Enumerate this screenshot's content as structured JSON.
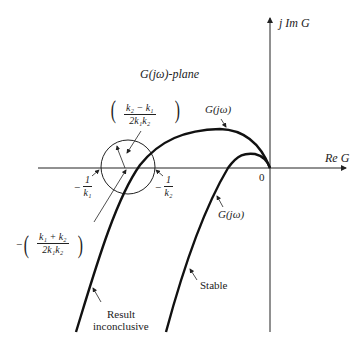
{
  "figure": {
    "plane_label": "G(jω)-plane",
    "axes": {
      "imag_label": "j Im G",
      "real_label": "Re G",
      "origin_label": "0"
    },
    "points": {
      "neg_inv_k1": {
        "sign": "−",
        "num": "1",
        "den": "k₁"
      },
      "neg_inv_k2": {
        "sign": "−",
        "num": "1",
        "den": "k₂"
      }
    },
    "circle": {
      "radius_label": {
        "num": "k₂ − k₁",
        "den": "2k₁k₂"
      },
      "center_label": {
        "sign": "−",
        "num": "k₁ + k₂",
        "den": "2k₁k₂"
      }
    },
    "curves": [
      {
        "name": "inconclusive",
        "label": "G(jω)",
        "annotation_line1": "Result",
        "annotation_line2": "inconclusive"
      },
      {
        "name": "stable",
        "label": "G(jω)",
        "annotation": "Stable"
      }
    ],
    "colors": {
      "ink": "#222222",
      "background": "#ffffff"
    }
  }
}
